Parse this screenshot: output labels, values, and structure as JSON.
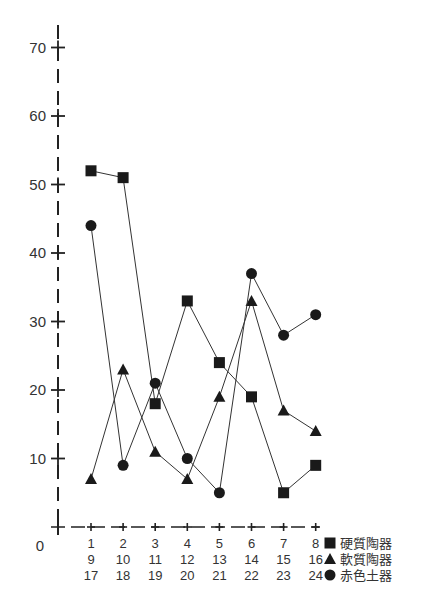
{
  "chart_data": {
    "type": "line",
    "title": "",
    "xlabel": "",
    "ylabel": "",
    "ylim": [
      0,
      70
    ],
    "yticks": [
      0,
      10,
      20,
      30,
      40,
      50,
      60,
      70
    ],
    "ytick_labels": [
      "0",
      "10",
      "20",
      "30",
      "40",
      "50",
      "60",
      "70"
    ],
    "categories": [
      1,
      2,
      3,
      4,
      5,
      6,
      7,
      8
    ],
    "xtick_label_rows": [
      [
        "1",
        "2",
        "3",
        "4",
        "5",
        "6",
        "7",
        "8"
      ],
      [
        "9",
        "10",
        "11",
        "12",
        "13",
        "14",
        "15",
        "16"
      ],
      [
        "17",
        "18",
        "19",
        "20",
        "21",
        "22",
        "23",
        "24"
      ]
    ],
    "grid": false,
    "legend_position": "bottom-right",
    "series": [
      {
        "name": "硬質陶器",
        "marker": "square",
        "color": "#1a1a1a",
        "values": [
          52,
          51,
          18,
          33,
          24,
          19,
          5,
          9
        ]
      },
      {
        "name": "軟質陶器",
        "marker": "triangle",
        "color": "#1a1a1a",
        "values": [
          7,
          23,
          11,
          7,
          19,
          33,
          17,
          14
        ]
      },
      {
        "name": "赤色土器",
        "marker": "circle",
        "color": "#1a1a1a",
        "values": [
          44,
          9,
          21,
          10,
          5,
          37,
          28,
          31
        ]
      }
    ]
  }
}
